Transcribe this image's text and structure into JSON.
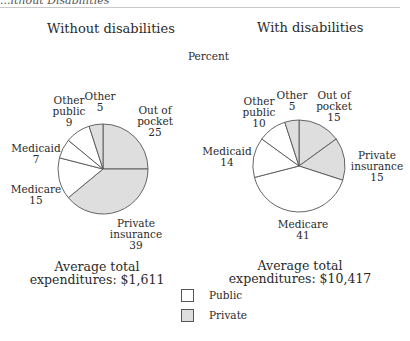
{
  "header": {
    "cut_title": "...ithout Disabilities"
  },
  "unit_label": "Percent",
  "colors": {
    "public": "#ffffff",
    "private": "#dedede",
    "stroke": "#555555"
  },
  "legend": [
    {
      "label": "Public",
      "color": "#ffffff"
    },
    {
      "label": "Private",
      "color": "#dedede"
    }
  ],
  "charts": {
    "left": {
      "title": "Without disabilities",
      "labels": {
        "other": {
          "name": "Other",
          "value": "5"
        },
        "other_public": {
          "name1": "Other",
          "name2": "public",
          "value": "9"
        },
        "medicaid": {
          "name": "Medicaid",
          "value": "7"
        },
        "medicare": {
          "name": "Medicare",
          "value": "15"
        },
        "out_of_pocket": {
          "name1": "Out of",
          "name2": "pocket",
          "value": "25"
        },
        "private_insurance": {
          "name1": "Private",
          "name2": "insurance",
          "value": "39"
        }
      },
      "avg_line1": "Average total",
      "avg_line2": "expenditures: $1,611"
    },
    "right": {
      "title": "With disabilities",
      "labels": {
        "other": {
          "name": "Other",
          "value": "5"
        },
        "other_public": {
          "name1": "Other",
          "name2": "public",
          "value": "10"
        },
        "medicaid": {
          "name": "Medicaid",
          "value": "14"
        },
        "medicare": {
          "name": "Medicare",
          "value": "41"
        },
        "out_of_pocket": {
          "name1": "Out of",
          "name2": "pocket",
          "value": "15"
        },
        "private_insurance": {
          "name1": "Private",
          "name2": "insurance",
          "value": "15"
        }
      },
      "avg_line1": "Average total",
      "avg_line2": "expenditures: $10,417"
    }
  },
  "chart_data": [
    {
      "type": "pie",
      "title": "Without disabilities",
      "unit": "Percent",
      "categories": [
        "Out of pocket",
        "Private insurance",
        "Medicare",
        "Medicaid",
        "Other public",
        "Other"
      ],
      "values": [
        25,
        39,
        15,
        7,
        9,
        5
      ],
      "groups": [
        "Private",
        "Private",
        "Public",
        "Public",
        "Public",
        "Private"
      ],
      "annotation": "Average total expenditures: $1,611"
    },
    {
      "type": "pie",
      "title": "With disabilities",
      "unit": "Percent",
      "categories": [
        "Out of pocket",
        "Private insurance",
        "Medicare",
        "Medicaid",
        "Other public",
        "Other"
      ],
      "values": [
        15,
        15,
        41,
        14,
        10,
        5
      ],
      "groups": [
        "Private",
        "Private",
        "Public",
        "Public",
        "Public",
        "Private"
      ],
      "annotation": "Average total expenditures: $10,417"
    }
  ]
}
